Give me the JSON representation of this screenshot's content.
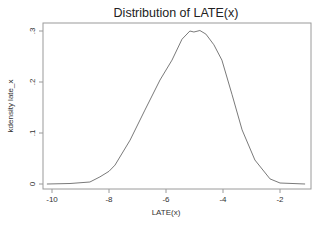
{
  "chart_data": {
    "type": "line",
    "title": "Distribution of LATE(x)",
    "xlabel": "LATE(x)",
    "ylabel": "kdensity late_x",
    "xlim": [
      -10.2,
      -1.05
    ],
    "ylim": [
      0,
      0.3
    ],
    "x_ticks": [
      -10,
      -8,
      -6,
      -4,
      -2
    ],
    "x_tick_labels": [
      "-10",
      "-8",
      "-6",
      "-4",
      "-2"
    ],
    "y_ticks": [
      0,
      0.1,
      0.2,
      0.3
    ],
    "y_tick_labels": [
      "0",
      ".1",
      ".2",
      ".3"
    ],
    "grid": false,
    "legend": null,
    "series": [
      {
        "name": "kdensity late_x",
        "color": "#7a7a7a",
        "x": [
          -10.18,
          -9.37,
          -8.67,
          -8.32,
          -8.0,
          -7.79,
          -7.26,
          -6.74,
          -6.21,
          -5.79,
          -5.44,
          -5.16,
          -5.02,
          -4.81,
          -4.6,
          -4.32,
          -4.04,
          -3.68,
          -3.33,
          -2.88,
          -2.35,
          -2.0,
          -1.12
        ],
        "y": [
          0.0,
          0.001,
          0.004,
          0.014,
          0.025,
          0.037,
          0.086,
          0.145,
          0.204,
          0.243,
          0.284,
          0.3,
          0.298,
          0.301,
          0.294,
          0.273,
          0.243,
          0.175,
          0.106,
          0.047,
          0.01,
          0.002,
          0.0
        ]
      }
    ]
  }
}
